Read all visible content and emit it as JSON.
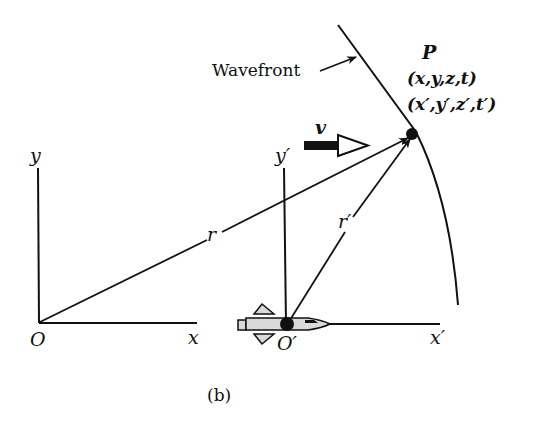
{
  "diagram": {
    "panel_label": "(b)",
    "wavefront_label": "Wavefront",
    "point": {
      "name": "P",
      "coords_unprimed": "(x,y,z,t)",
      "coords_primed": "(x′,y′,z′,t′)"
    },
    "velocity_label": "v",
    "frame_s": {
      "origin": "O",
      "x_axis": "x",
      "y_axis": "y"
    },
    "frame_s_prime": {
      "origin": "O′",
      "x_axis": "x′",
      "y_axis": "y′"
    },
    "vectors": {
      "r": "r",
      "r_prime": "r′"
    },
    "colors": {
      "ink": "#111111",
      "rocket_fill": "#d9d9d9",
      "background": "#ffffff"
    }
  }
}
